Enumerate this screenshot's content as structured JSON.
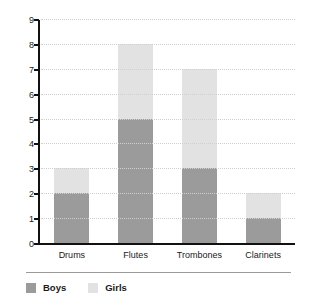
{
  "chart_data": {
    "type": "bar",
    "subtype": "stacked-vertical",
    "title": "",
    "subtitle": "",
    "xlabel": "",
    "ylabel": "",
    "categories": [
      "Drums",
      "Flutes",
      "Trombones",
      "Clarinets"
    ],
    "series": [
      {
        "name": "Boys",
        "color": "#9b9b9b",
        "values": [
          2,
          5,
          3,
          1
        ]
      },
      {
        "name": "Girls",
        "color": "#e2e2e2",
        "values": [
          1,
          3,
          4,
          1
        ]
      }
    ],
    "totals": [
      3,
      8,
      7,
      2
    ],
    "ylim": [
      0,
      9
    ],
    "ytick_step": 1,
    "yticks": [
      0,
      1,
      2,
      3,
      4,
      5,
      6,
      7,
      8,
      9
    ],
    "ytick_labels": [
      "0",
      "1",
      "2",
      "3",
      "4",
      "5",
      "6",
      "7",
      "8",
      "9"
    ],
    "grid": true,
    "grid_style": "dotted",
    "grid_color": "#cfcfcf",
    "legend_position": "bottom-left",
    "legend": [
      {
        "label": "Boys",
        "color": "#9b9b9b"
      },
      {
        "label": "Girls",
        "color": "#e2e2e2"
      }
    ],
    "axis_color": "#111111",
    "background": "#ffffff"
  }
}
